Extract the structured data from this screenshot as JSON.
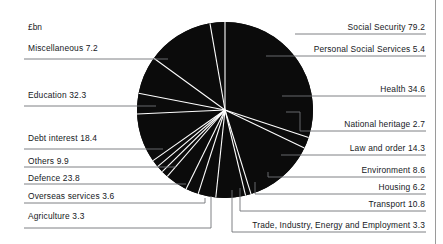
{
  "figure": {
    "unit_label": "£bn",
    "background_color": "#ffffff",
    "slice_color": "#0b0b0b",
    "divider_color": "#ffffff",
    "leader_color": "#6f7377",
    "text_color": "#15181c"
  },
  "chart_data": {
    "type": "pie",
    "title": "",
    "subtitle": "",
    "xlabel": "",
    "ylabel": "",
    "unit": "£bn",
    "total": 263.6,
    "legend_position": "callout-labels",
    "grid": false,
    "start_angle_deg": 0,
    "direction": "clockwise",
    "categories": [
      "Social Security",
      "Personal Social Services",
      "Health",
      "National heritage",
      "Law and order",
      "Environment",
      "Housing",
      "Transport",
      "Trade, Industry, Energy and Employment",
      "Agriculture",
      "Overseas services",
      "Defence",
      "Others",
      "Debt interest",
      "Education",
      "Miscellaneous"
    ],
    "values": [
      79.2,
      5.4,
      34.6,
      2.7,
      14.3,
      8.6,
      6.2,
      10.8,
      3.3,
      3.3,
      3.6,
      23.8,
      9.9,
      18.4,
      32.3,
      7.2
    ],
    "labels": [
      "Social Security 79.2",
      "Personal Social Services 5.4",
      "Health 34.6",
      "National heritage 2.7",
      "Law and order 14.3",
      "Environment 8.6",
      "Housing 6.2",
      "Transport 10.8",
      "Trade, Industry, Energy and Employment 3.3",
      "Agriculture 3.3",
      "Overseas services 3.6",
      "Defence 23.8",
      "Others 9.9",
      "Debt interest 18.4",
      "Education 32.3",
      "Miscellaneous 7.2"
    ]
  },
  "callouts": {
    "right": [
      {
        "text": "Social Security 79.2"
      },
      {
        "text": "Personal Social Services 5.4"
      },
      {
        "text": "Health 34.6"
      },
      {
        "text": "National heritage 2.7"
      },
      {
        "text": "Law and order 14.3"
      },
      {
        "text": "Environment 8.6"
      },
      {
        "text": "Housing 6.2"
      },
      {
        "text": "Transport 10.8"
      },
      {
        "text": "Trade, Industry, Energy and Employment 3.3"
      }
    ],
    "left": [
      {
        "text": "Miscellaneous 7.2"
      },
      {
        "text": "Education 32.3"
      },
      {
        "text": "Debt interest 18.4"
      },
      {
        "text": "Others 9.9"
      },
      {
        "text": "Defence 23.8"
      },
      {
        "text": "Overseas services 3.6"
      },
      {
        "text": "Agriculture 3.3"
      }
    ]
  }
}
